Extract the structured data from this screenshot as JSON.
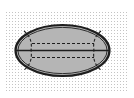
{
  "diagram": {
    "title": "",
    "background": {
      "color": "#ffffff",
      "stipple": {
        "x": 5,
        "y": 10,
        "width": 123,
        "height": 82,
        "dot_color": "#c4c4c4",
        "spacing": 3
      }
    },
    "shape": {
      "type": "ellipse",
      "cx": 62.5,
      "cy": 50.5,
      "rx": 47,
      "ry": 25.5,
      "fill": "#b5b5b5",
      "outline_color": "#1e1e1e",
      "outer_stroke_width": 2.2,
      "inner_outline_inset": 2.4,
      "inner_stroke_width": 0.9
    },
    "lines": {
      "center_solid": {
        "x1": 16,
        "x2": 109,
        "y": 50.5,
        "color": "#1e1e1e",
        "width": 1.6
      },
      "upper_dashed": {
        "x1": 32,
        "x2": 94,
        "y": 43.5,
        "color": "#1e1e1e",
        "width": 1.2,
        "dash": "3,2"
      },
      "lower_dashed": {
        "x1": 32,
        "x2": 94,
        "y": 57.5,
        "color": "#1e1e1e",
        "width": 1.2,
        "dash": "3,2"
      },
      "left_arc": "M 24 31 Q 33 38 31 50.5 Q 33 63 24 70",
      "right_arc": "M 101 31 Q 92 38 94 50.5 Q 92 63 101 70"
    },
    "labels": []
  }
}
